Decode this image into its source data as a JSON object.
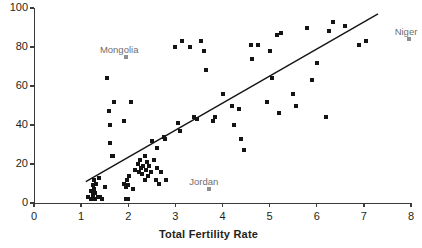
{
  "chart_data": {
    "type": "scatter",
    "title": "",
    "xlabel": "Total Fertility Rate",
    "ylabel": "",
    "xlim": [
      0,
      8
    ],
    "ylim": [
      0,
      100
    ],
    "grid": false,
    "legend": null,
    "xticks": [
      "0",
      "1",
      "2",
      "3",
      "4",
      "5",
      "6",
      "7",
      "8"
    ],
    "xtick_values": [
      0,
      1,
      2,
      3,
      4,
      5,
      6,
      7,
      8
    ],
    "yticks": [
      "0",
      "20",
      "40",
      "60",
      "80",
      "100"
    ],
    "ytick_values": [
      0,
      20,
      40,
      60,
      80,
      100
    ],
    "marker_color": "#141414",
    "highlight_marker_color": "#8f8f8f",
    "axis_color": "#3b3b3b",
    "trendline": {
      "x": [
        1.1,
        7.3
      ],
      "y": [
        11,
        97
      ],
      "color": "#141414"
    },
    "points": [
      [
        1.15,
        3
      ],
      [
        1.2,
        2
      ],
      [
        1.22,
        6
      ],
      [
        1.25,
        9
      ],
      [
        1.25,
        4
      ],
      [
        1.28,
        12
      ],
      [
        1.28,
        7
      ],
      [
        1.3,
        2
      ],
      [
        1.3,
        5
      ],
      [
        1.32,
        10
      ],
      [
        1.35,
        3
      ],
      [
        1.38,
        13
      ],
      [
        1.4,
        3
      ],
      [
        1.45,
        2
      ],
      [
        1.5,
        8
      ],
      [
        1.55,
        64
      ],
      [
        1.6,
        47
      ],
      [
        1.62,
        31
      ],
      [
        1.62,
        40
      ],
      [
        1.65,
        24
      ],
      [
        1.68,
        24
      ],
      [
        1.7,
        52
      ],
      [
        1.9,
        42
      ],
      [
        1.92,
        10
      ],
      [
        1.95,
        8
      ],
      [
        1.95,
        2
      ],
      [
        1.98,
        12
      ],
      [
        2.0,
        9
      ],
      [
        2.0,
        2
      ],
      [
        2.02,
        14
      ],
      [
        2.05,
        52
      ],
      [
        2.1,
        7
      ],
      [
        2.15,
        17
      ],
      [
        2.2,
        20
      ],
      [
        2.22,
        16
      ],
      [
        2.25,
        22
      ],
      [
        2.28,
        18
      ],
      [
        2.3,
        15
      ],
      [
        2.32,
        19
      ],
      [
        2.35,
        24
      ],
      [
        2.35,
        12
      ],
      [
        2.38,
        17
      ],
      [
        2.4,
        21
      ],
      [
        2.42,
        14
      ],
      [
        2.45,
        19
      ],
      [
        2.48,
        16
      ],
      [
        2.5,
        32
      ],
      [
        2.55,
        22
      ],
      [
        2.58,
        12
      ],
      [
        2.6,
        18
      ],
      [
        2.62,
        28
      ],
      [
        2.65,
        10
      ],
      [
        2.7,
        16
      ],
      [
        2.75,
        34
      ],
      [
        2.78,
        33
      ],
      [
        2.8,
        12
      ],
      [
        3.0,
        80
      ],
      [
        3.05,
        41
      ],
      [
        3.1,
        37
      ],
      [
        3.15,
        83
      ],
      [
        3.3,
        80
      ],
      [
        3.4,
        44
      ],
      [
        3.45,
        43
      ],
      [
        3.55,
        83
      ],
      [
        3.6,
        78
      ],
      [
        3.65,
        68
      ],
      [
        3.8,
        42
      ],
      [
        3.85,
        44
      ],
      [
        4.0,
        56
      ],
      [
        4.2,
        50
      ],
      [
        4.25,
        40
      ],
      [
        4.35,
        48
      ],
      [
        4.4,
        33
      ],
      [
        4.45,
        27
      ],
      [
        4.6,
        81
      ],
      [
        4.62,
        74
      ],
      [
        4.75,
        81
      ],
      [
        4.95,
        52
      ],
      [
        5.0,
        78
      ],
      [
        5.05,
        64
      ],
      [
        5.15,
        86
      ],
      [
        5.2,
        46
      ],
      [
        5.25,
        87
      ],
      [
        5.5,
        56
      ],
      [
        5.55,
        50
      ],
      [
        5.8,
        90
      ],
      [
        5.9,
        63
      ],
      [
        6.0,
        72
      ],
      [
        6.2,
        44
      ],
      [
        6.25,
        88
      ],
      [
        6.35,
        93
      ],
      [
        6.6,
        91
      ],
      [
        6.9,
        81
      ],
      [
        7.05,
        83
      ]
    ],
    "highlighted": [
      {
        "label": "Mongolia",
        "x": 1.95,
        "y": 75,
        "label_dx": -26,
        "label_dy": -13
      },
      {
        "label": "Jordan",
        "x": 3.72,
        "y": 7,
        "label_dx": -20,
        "label_dy": -13
      },
      {
        "label": "Niger",
        "x": 7.95,
        "y": 84,
        "label_dx": -14,
        "label_dy": -13
      }
    ]
  }
}
